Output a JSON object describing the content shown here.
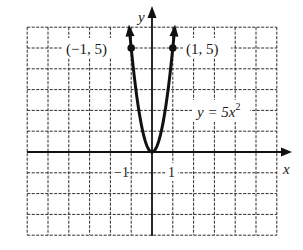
{
  "chart_data": {
    "type": "line",
    "title": "",
    "xlabel": "x",
    "ylabel": "y",
    "xlim": [
      -6,
      6
    ],
    "ylim": [
      -4,
      6
    ],
    "grid": true,
    "grid_style": "dashed",
    "tick_labels": {
      "x": [
        "-1",
        "1"
      ]
    },
    "series": [
      {
        "name": "y = 5x^2",
        "equation": "y = 5x²",
        "x": [
          -1.09,
          -1,
          -0.75,
          -0.5,
          -0.25,
          0,
          0.25,
          0.5,
          0.75,
          1,
          1.09
        ],
        "y": [
          5.94,
          5,
          2.8125,
          1.25,
          0.3125,
          0,
          0.3125,
          1.25,
          2.8125,
          5,
          5.94
        ],
        "arrows_at_ends": true
      }
    ],
    "annotations": [
      {
        "text": "(−1, 5)",
        "x": -1,
        "y": 5,
        "marker": "dot"
      },
      {
        "text": "(1, 5)",
        "x": 1,
        "y": 5,
        "marker": "dot"
      },
      {
        "text": "y = 5x²",
        "x": 2.6,
        "y": 2,
        "role": "curve-label"
      }
    ]
  },
  "labels": {
    "x_axis": "x",
    "y_axis": "y",
    "tick_neg1": "−1",
    "tick_pos1": "1",
    "point_left": "(−1, 5)",
    "point_right": "(1, 5)",
    "equation_main": "y = 5x",
    "equation_exp": "2"
  }
}
